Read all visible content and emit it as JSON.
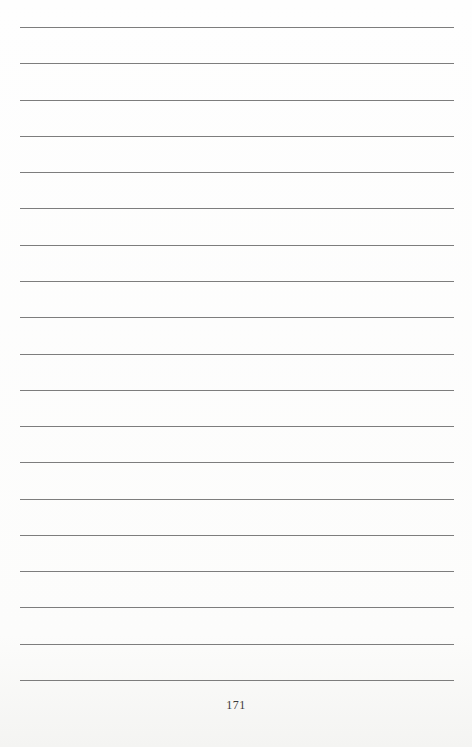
{
  "page": {
    "type": "ruled-notes-page",
    "line_count": 19,
    "rule_color": "#7d7d7d",
    "page_number": "171"
  }
}
